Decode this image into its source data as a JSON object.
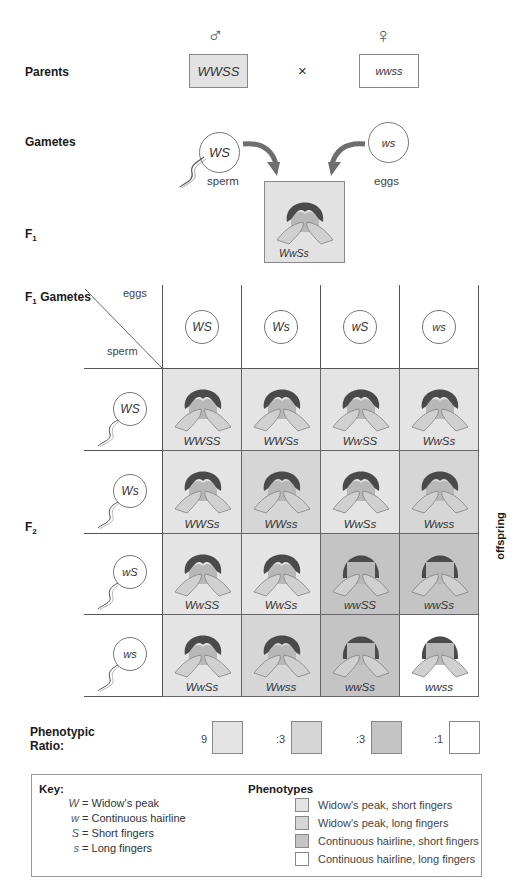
{
  "colors": {
    "wp_short": "#e4e4e4",
    "wp_long": "#d6d6d6",
    "ch_short": "#c4c4c4",
    "ch_long": "#ffffff",
    "parent_male_fill": "#e2e2e2",
    "arrow": "#6e6e6e",
    "hair": "#4a4a4a",
    "skin": "#bdbdbd"
  },
  "parents": {
    "label": "Parents",
    "male_symbol": "♂",
    "female_symbol": "♀",
    "male_genotype": "WWSS",
    "cross": "×",
    "female_genotype": "wwss"
  },
  "gametes": {
    "label": "Gametes",
    "sperm_genotype": "WS",
    "sperm_label": "sperm",
    "egg_genotype": "ws",
    "egg_label": "eggs"
  },
  "f1": {
    "label": "F",
    "subscript": "1",
    "genotype": "WwSs"
  },
  "punnett": {
    "title": "F",
    "title_sub": "1",
    "title_rest": " Gametes",
    "eggs_label": "eggs",
    "sperm_label": "sperm",
    "f2_label": "F",
    "f2_sub": "2",
    "offspring_label": "offspring",
    "egg_gametes": [
      "WS",
      "Ws",
      "wS",
      "ws"
    ],
    "sperm_gametes": [
      "WS",
      "Ws",
      "wS",
      "ws"
    ],
    "rows": [
      [
        {
          "genotype": "WWSS",
          "phenotype": "wp_short"
        },
        {
          "genotype": "WWSs",
          "phenotype": "wp_short"
        },
        {
          "genotype": "WwSS",
          "phenotype": "wp_short"
        },
        {
          "genotype": "WwSs",
          "phenotype": "wp_short"
        }
      ],
      [
        {
          "genotype": "WWSs",
          "phenotype": "wp_short"
        },
        {
          "genotype": "WWss",
          "phenotype": "wp_long"
        },
        {
          "genotype": "WwSs",
          "phenotype": "wp_short"
        },
        {
          "genotype": "Wwss",
          "phenotype": "wp_long"
        }
      ],
      [
        {
          "genotype": "WwSS",
          "phenotype": "wp_short"
        },
        {
          "genotype": "WwSs",
          "phenotype": "wp_short"
        },
        {
          "genotype": "wwSS",
          "phenotype": "ch_short"
        },
        {
          "genotype": "wwSs",
          "phenotype": "ch_short"
        }
      ],
      [
        {
          "genotype": "WwSs",
          "phenotype": "wp_short"
        },
        {
          "genotype": "Wwss",
          "phenotype": "wp_long"
        },
        {
          "genotype": "wwSs",
          "phenotype": "ch_short"
        },
        {
          "genotype": "wwss",
          "phenotype": "ch_long"
        }
      ]
    ]
  },
  "ratio": {
    "label_line1": "Phenotypic",
    "label_line2": "Ratio:",
    "items": [
      {
        "value": "9",
        "phenotype": "wp_short"
      },
      {
        "value": ":3",
        "phenotype": "wp_long"
      },
      {
        "value": ":3",
        "phenotype": "ch_short"
      },
      {
        "value": ":1",
        "phenotype": "ch_long"
      }
    ]
  },
  "key": {
    "title": "Key:",
    "alleles": [
      {
        "symbol": "W",
        "meaning": "= Widow's peak"
      },
      {
        "symbol": "w",
        "meaning": "= Continuous hairline"
      },
      {
        "symbol": "S",
        "meaning": "= Short fingers"
      },
      {
        "symbol": "s",
        "meaning": "= Long fingers"
      }
    ],
    "phenotypes_title": "Phenotypes",
    "phenotypes": [
      {
        "label": "Widow's peak, short fingers",
        "phenotype": "wp_short"
      },
      {
        "label": "Widow's peak, long fingers",
        "phenotype": "wp_long"
      },
      {
        "label": "Continuous hairline, short fingers",
        "phenotype": "ch_short"
      },
      {
        "label": "Continuous hairline, long fingers",
        "phenotype": "ch_long"
      }
    ]
  }
}
